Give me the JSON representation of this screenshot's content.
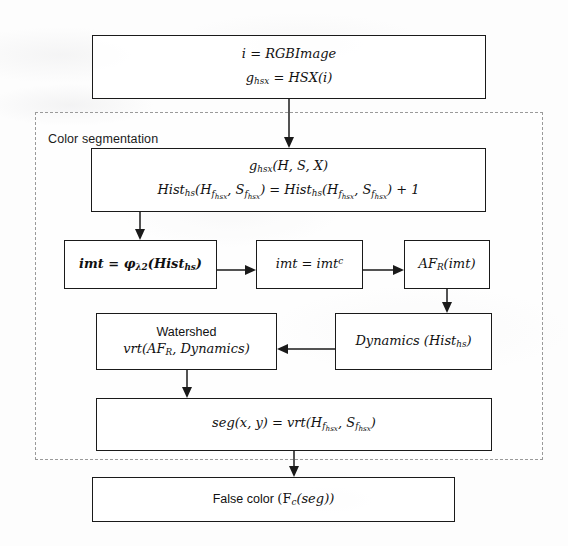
{
  "diagram": {
    "group": {
      "label": "Color segmentation"
    },
    "nodes": {
      "input": {
        "line1_lhs": "i",
        "line1_eq": " = ",
        "line1_rhs": "RGBImage",
        "line2_lhs": "g",
        "line2_lhs_sub": "hsx",
        "line2_eq": " = ",
        "line2_rhs": "HSX(i)"
      },
      "histogram": {
        "line1_fn": "g",
        "line1_fn_sub": "hsx",
        "line1_args": "(H, S, X)",
        "line2_a": "Hist",
        "line2_a_sub": "hs",
        "line2_b": "(H",
        "line2_b_sub": "f",
        "line2_b_sub2": "hsx",
        "line2_c": ", S",
        "line2_c_sub": "f",
        "line2_c_sub2": "hsx",
        "line2_d": ") = ",
        "line2_e": "Hist",
        "line2_e_sub": "hs",
        "line2_f": "(H",
        "line2_f_sub": "f",
        "line2_f_sub2": "hsx",
        "line2_g": ", S",
        "line2_g_sub": "f",
        "line2_g_sub2": "hsx",
        "line2_h": ") + 1"
      },
      "filter": {
        "lhs": "imt",
        "eq": " = ",
        "op": "φ",
        "op_sub": "λ2",
        "args_open": "(Hist",
        "args_sub": "hs",
        "args_close": ")"
      },
      "complement": {
        "lhs": "imt",
        "eq": " = ",
        "rhs": "imt",
        "rhs_sup": "c"
      },
      "afr": {
        "fn": "AF",
        "fn_sub": "R",
        "args": "(imt)"
      },
      "dynamics": {
        "fn": "Dynamics ",
        "args_open": "(Hist",
        "args_sub": "hs",
        "args_close": ")"
      },
      "watershed": {
        "line1": "Watershed",
        "line2_fn": "vrt(AF",
        "line2_sub": "R",
        "line2_rest": ", Dynamics)"
      },
      "segmentation": {
        "lhs": "seg(x, y)",
        "eq": " = ",
        "fn": "vrt(H",
        "a_sub": "f",
        "a_sub2": "hsx",
        "mid": ", S",
        "b_sub": "f",
        "b_sub2": "hsx",
        "close": ")"
      },
      "falsecolor": {
        "label": "False color ",
        "fn_open": "(F",
        "fn_sub": "c",
        "fn_args": "(seg))"
      }
    },
    "colors": {
      "stroke": "#1a1a1a",
      "group_stroke": "#9a9a9a",
      "background": "#fdfdfd",
      "text": "#111111"
    }
  }
}
